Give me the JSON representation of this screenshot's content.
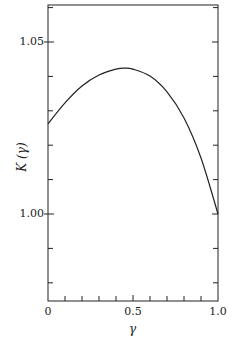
{
  "chart_data": {
    "type": "line",
    "title": "",
    "xlabel": "γ",
    "ylabel": "K (γ)",
    "xlim": [
      0,
      1.0
    ],
    "ylim": [
      0.975,
      1.061
    ],
    "grid": false,
    "legend": null,
    "x_ticks": [
      0,
      0.5,
      1.0
    ],
    "x_tick_labels": [
      "0",
      "0.5",
      "1.0"
    ],
    "x_minor_tick_step": 0.1,
    "y_ticks": [
      1.0,
      1.05
    ],
    "y_tick_labels": [
      "1.00",
      "1.05"
    ],
    "y_minor_tick_step": 0.01,
    "series": [
      {
        "name": "K(γ)",
        "x": [
          0.0,
          0.1,
          0.2,
          0.3,
          0.4,
          0.45,
          0.5,
          0.6,
          0.7,
          0.8,
          0.9,
          1.0
        ],
        "values": [
          1.0262,
          1.0323,
          1.0372,
          1.0404,
          1.0421,
          1.0424,
          1.0421,
          1.0401,
          1.0355,
          1.0279,
          1.0163,
          1.0
        ]
      }
    ]
  },
  "labels": {
    "y_axis": "K (γ)",
    "x_axis": "γ",
    "y_tick_1": "1.05",
    "y_tick_2": "1.00",
    "x_tick_1": "0",
    "x_tick_2": "0.5",
    "x_tick_3": "1.0"
  }
}
